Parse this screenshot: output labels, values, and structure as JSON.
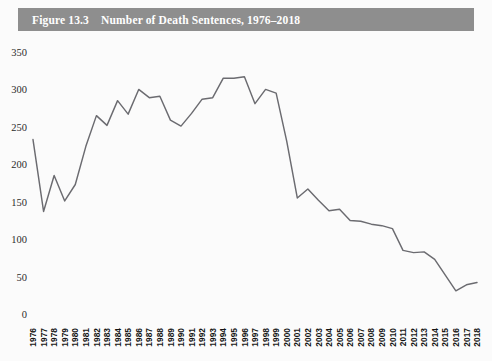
{
  "figure": {
    "bar_label": "Figure 13.3",
    "title": "Number of Death Sentences, 1976–2018",
    "full_title": "Figure 13.3    Number of Death Sentences, 1976–2018",
    "bar_color": "#8e8e8e",
    "title_color": "#ffffff",
    "background_color": "#fbfbfb"
  },
  "chart_data": {
    "type": "line",
    "title": "Number of Death Sentences, 1976–2018",
    "xlabel": "",
    "ylabel": "",
    "ylim": [
      0,
      350
    ],
    "ytick_values": [
      0,
      50,
      100,
      150,
      200,
      250,
      300,
      350
    ],
    "ytick_labels": [
      "0",
      "50",
      "100",
      "150",
      "200",
      "250",
      "300",
      "350"
    ],
    "grid": false,
    "legend": false,
    "legend_position": "none",
    "line_color": "#6b6b70",
    "categories": [
      "1976",
      "1977",
      "1978",
      "1979",
      "1980",
      "1981",
      "1982",
      "1983",
      "1984",
      "1985",
      "1986",
      "1987",
      "1988",
      "1989",
      "1990",
      "1991",
      "1992",
      "1993",
      "1994",
      "1995",
      "1996",
      "1997",
      "1998",
      "1999",
      "2000",
      "2001",
      "2002",
      "2003",
      "2004",
      "2005",
      "2006",
      "2007",
      "2008",
      "2009",
      "2010",
      "2011",
      "2012",
      "2013",
      "2014",
      "2015",
      "2016",
      "2017",
      "2018"
    ],
    "values": [
      233,
      137,
      185,
      151,
      173,
      224,
      265,
      252,
      285,
      267,
      300,
      289,
      291,
      259,
      251,
      268,
      287,
      289,
      315,
      315,
      317,
      281,
      300,
      295,
      231,
      155,
      167,
      152,
      138,
      140,
      125,
      124,
      120,
      118,
      114,
      85,
      82,
      83,
      73,
      52,
      31,
      39,
      42
    ],
    "series": [
      {
        "name": "Death sentences",
        "values": [
          233,
          137,
          185,
          151,
          173,
          224,
          265,
          252,
          285,
          267,
          300,
          289,
          291,
          259,
          251,
          268,
          287,
          289,
          315,
          315,
          317,
          281,
          300,
          295,
          231,
          155,
          167,
          152,
          138,
          140,
          125,
          124,
          120,
          118,
          114,
          85,
          82,
          83,
          73,
          52,
          31,
          39,
          42
        ]
      }
    ]
  }
}
